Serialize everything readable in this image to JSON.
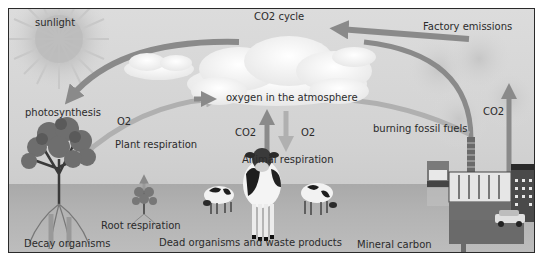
{
  "diagram": {
    "title": "CO2 cycle",
    "labels": {
      "sunlight": "sunlight",
      "co2_cycle": "CO2 cycle",
      "factory_emissions": "Factory emissions",
      "photosynthesis": "photosynthesis",
      "o2_left": "O2",
      "oxygen_atmosphere": "oxygen in the atmosphere",
      "co2_up": "CO2",
      "o2_down": "O2",
      "co2_right": "CO2",
      "burning_fossil_fuels": "burning fossil fuels",
      "plant_respiration": "Plant respiration",
      "animal_respiration": "Animal respiration",
      "root_respiration": "Root respiration",
      "decay_organisms": "Decay organisms",
      "dead_organisms": "Dead organisms and waste products",
      "mineral_carbon": "Mineral carbon"
    },
    "elements": [
      "sun",
      "clouds",
      "large-tree",
      "small-tree",
      "cows",
      "truck",
      "factory",
      "car",
      "smoke"
    ],
    "colors": {
      "background": "#d4d4d4",
      "ground": "#b0b0b0",
      "arrow": "#8a8a8a",
      "arrow_light": "#b5b5b5",
      "text": "#2b2b2b",
      "border": "#2a2a2a"
    }
  }
}
